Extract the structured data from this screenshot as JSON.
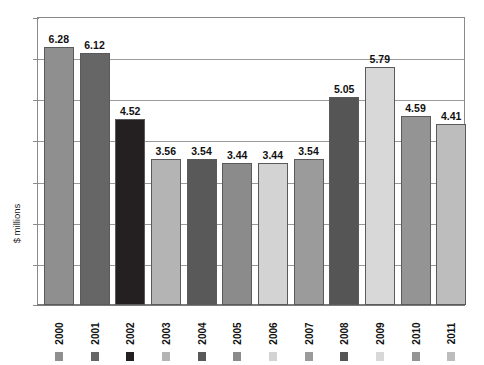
{
  "title_fragment": "",
  "chart_data": {
    "type": "bar",
    "title": "",
    "subtitle": "",
    "xlabel": "",
    "ylabel": "$ millions",
    "ylim": [
      0,
      7
    ],
    "ytick_interval": 1,
    "ytick_labels_visible": false,
    "grid": true,
    "legend_position": "below-category-labels",
    "categories": [
      "2000",
      "2001",
      "2002",
      "2003",
      "2004",
      "2005",
      "2006",
      "2007",
      "2008",
      "2009",
      "2010",
      "2011"
    ],
    "values": [
      6.28,
      6.12,
      4.52,
      3.56,
      3.54,
      3.44,
      3.44,
      3.54,
      5.05,
      5.79,
      4.59,
      4.41
    ],
    "value_labels": [
      "6.28",
      "6.12",
      "4.52",
      "3.56",
      "3.54",
      "3.44",
      "3.44",
      "3.54",
      "5.05",
      "5.79",
      "4.59",
      "4.41"
    ],
    "bar_colors": [
      "#8f8f8f",
      "#666666",
      "#241f20",
      "#b4b4b4",
      "#595959",
      "#8b8b8b",
      "#d3d3d3",
      "#9b9b9b",
      "#555555",
      "#d8d8d8",
      "#949494",
      "#bdbdbd"
    ],
    "series": [
      {
        "name": "$ millions",
        "values": [
          6.28,
          6.12,
          4.52,
          3.56,
          3.54,
          3.44,
          3.44,
          3.54,
          5.05,
          5.79,
          4.59,
          4.41
        ]
      }
    ]
  },
  "axis": {
    "y_label": "$ millions",
    "gridline_count": 6,
    "frame_color": "#8a8a8a",
    "grid_color": "#9a9a9a"
  }
}
